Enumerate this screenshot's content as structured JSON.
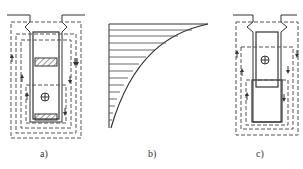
{
  "figure": {
    "panels": [
      {
        "id": "a",
        "label": "a)",
        "description": "Rotor slot with two conductor bars (hatched) and leakage flux paths (dashed) with direction arrows; center marker circle-plus"
      },
      {
        "id": "b",
        "label": "b)",
        "description": "Current density distribution along slot depth: curved profile with horizontal hatching"
      },
      {
        "id": "c",
        "label": "c)",
        "description": "Rotor slot with upper bar shifted; leakage flux paths (dashed) with arrows; center marker circle-plus"
      }
    ],
    "colors": {
      "line": "#333333",
      "dashed": "#555555",
      "background": "#ffffff"
    }
  }
}
